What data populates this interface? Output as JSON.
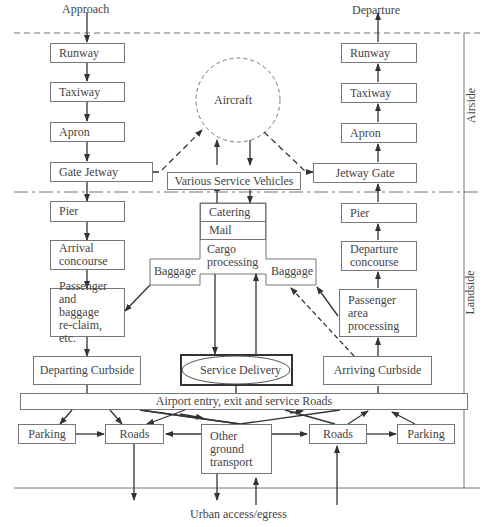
{
  "labels": {
    "approach": "Approach",
    "departure": "Departure",
    "airside": "Airside",
    "landside": "Landside",
    "urban": "Urban access/egress"
  },
  "arrival_chain": {
    "runway": "Runway",
    "taxiway": "Taxiway",
    "apron": "Apron",
    "gate_jetway": "Gate Jetway",
    "pier": "Pier",
    "arrival_concourse": [
      "Arrival",
      "concourse"
    ],
    "reclaim": [
      "Passenger",
      "and baggage",
      "re-claim, etc."
    ],
    "departing_curbside": "Departing Curbside"
  },
  "departure_chain": {
    "runway": "Runway",
    "taxiway": "Taxiway",
    "apron": "Apron",
    "jetway_gate": "Jetway Gate",
    "pier": "Pier",
    "departure_concourse": [
      "Departure",
      "concourse"
    ],
    "processing": [
      "Passenger",
      "area",
      "processing"
    ],
    "arriving_curbside": "Arriving Curbside"
  },
  "center": {
    "aircraft": "Aircraft",
    "service_vehicles": "Various Service Vehicles",
    "catering": "Catering",
    "mail": "Mail",
    "cargo": [
      "Cargo",
      "processing"
    ],
    "baggage_left": "Baggage",
    "baggage_right": "Baggage",
    "service_delivery": "Service Delivery"
  },
  "ground": {
    "entry_roads": "Airport entry, exit and service Roads",
    "parking_left": "Parking",
    "roads_left": "Roads",
    "other": [
      "Other",
      "ground",
      "transport"
    ],
    "roads_right": "Roads",
    "parking_right": "Parking"
  }
}
